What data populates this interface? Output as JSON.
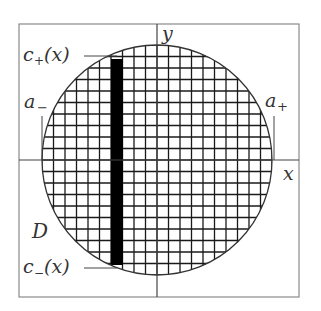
{
  "diagram": {
    "type": "region-grid-illustration",
    "labels": {
      "y_axis": "y",
      "x_axis": "x",
      "region": "D",
      "a_minus_base": "a",
      "a_minus_sub": "−",
      "a_plus_base": "a",
      "a_plus_sub": "+",
      "c_plus_base": "c",
      "c_plus_sub": "+",
      "c_plus_arg": "(x)",
      "c_minus_base": "c",
      "c_minus_sub": "−",
      "c_minus_arg": "(x)"
    },
    "geometry": {
      "frame": {
        "x": 19,
        "y": 24,
        "w": 280,
        "h": 273
      },
      "axis_origin": {
        "x": 157,
        "y": 160
      },
      "circle": {
        "cx": 157,
        "cy": 160,
        "r": 115
      },
      "grid_step": 11.5,
      "strip": {
        "x": 111,
        "w": 12,
        "y_top": 59,
        "y_bottom": 265
      },
      "colors": {
        "frame": "#888888",
        "grid": "#1a1a1a",
        "strip": "#000000",
        "circle": "#333333",
        "axis": "#444444"
      }
    }
  }
}
